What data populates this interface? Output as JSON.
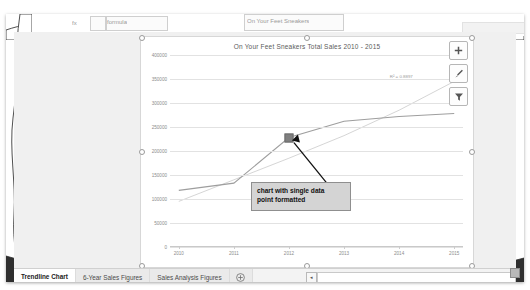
{
  "window": {
    "app_kind": "spreadsheet-chart-view",
    "top_fragments": [
      "fx",
      "formula",
      "On Your Feet Sneakers"
    ]
  },
  "chart": {
    "title": "On Your Feet Sneakers Total Sales 2010 - 2015",
    "r2_label": "R² = 0.8897",
    "buttons": [
      {
        "name": "chart-elements-button",
        "icon": "plus-icon",
        "label": "Chart Elements"
      },
      {
        "name": "chart-styles-button",
        "icon": "brush-icon",
        "label": "Chart Styles"
      },
      {
        "name": "chart-filters-button",
        "icon": "funnel-icon",
        "label": "Chart Filters"
      }
    ]
  },
  "callout": {
    "line1": "chart with single data",
    "line2": "point formatted"
  },
  "tabs": {
    "items": [
      {
        "label": "Trendline Chart",
        "active": true
      },
      {
        "label": "6-Year Sales Figures",
        "active": false
      },
      {
        "label": "Sales Analysis Figures",
        "active": false
      }
    ],
    "add_label": "+",
    "scroll_left_label": "◂"
  },
  "colors": {
    "series": "#9e9e9e",
    "trendline": "#d0d0d0",
    "marker": "#7f7f7f",
    "callout_bg": "#d4d4d4",
    "sheet_bg": "#efefef",
    "active_tab_accent": "#1f7a4d"
  },
  "chart_data": {
    "type": "line",
    "title": "On Your Feet Sneakers Total Sales 2010 - 2015",
    "xlabel": "",
    "ylabel": "",
    "categories": [
      "2010",
      "2011",
      "2012",
      "2013",
      "2014",
      "2015"
    ],
    "series": [
      {
        "name": "Total Sales",
        "values": [
          118000,
          133000,
          228000,
          262000,
          272000,
          278000
        ]
      },
      {
        "name": "Linear Trendline",
        "values": [
          95000,
          140000,
          185000,
          232000,
          285000,
          345000
        ],
        "style": "trendline"
      }
    ],
    "highlighted_point": {
      "category": "2012",
      "value": 228000,
      "marker": "square"
    },
    "ylim": [
      0,
      400000
    ],
    "yticks": [
      0,
      50000,
      100000,
      150000,
      200000,
      250000,
      300000,
      350000,
      400000
    ],
    "ytick_labels": [
      "0",
      "50000",
      "100000",
      "150000",
      "200000",
      "250000",
      "300000",
      "350000",
      "400000"
    ],
    "grid": true,
    "legend": "none",
    "annotations": [
      {
        "text": "R² = 0.8897",
        "target": "trendline"
      },
      {
        "text": "chart with single data point formatted",
        "target": "2012"
      }
    ]
  }
}
